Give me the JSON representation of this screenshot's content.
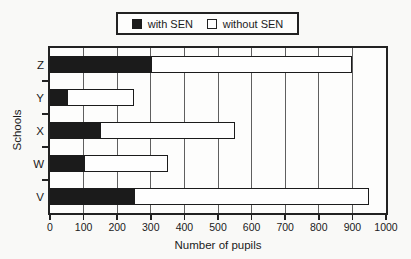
{
  "figure": {
    "background": "#f9f9f7",
    "ink": "#1b1b1b"
  },
  "chart_data": {
    "type": "bar",
    "orientation": "horizontal",
    "stacked": true,
    "title": "",
    "xlabel": "Number of pupils",
    "ylabel": "Schools",
    "categories": [
      "Z",
      "Y",
      "X",
      "W",
      "V"
    ],
    "series": [
      {
        "name": "with SEN",
        "color": "#1b1b1b",
        "values": [
          300,
          50,
          150,
          100,
          250
        ]
      },
      {
        "name": "without SEN",
        "color": "#fefefe",
        "values": [
          600,
          200,
          400,
          250,
          700
        ]
      }
    ],
    "totals": [
      900,
      250,
      550,
      350,
      950
    ],
    "xlim": [
      0,
      1000
    ],
    "x_ticks": [
      0,
      100,
      200,
      300,
      400,
      500,
      600,
      700,
      800,
      900,
      1000
    ],
    "grid": "vertical-gridlines-every-100",
    "legend_position": "top-center"
  }
}
